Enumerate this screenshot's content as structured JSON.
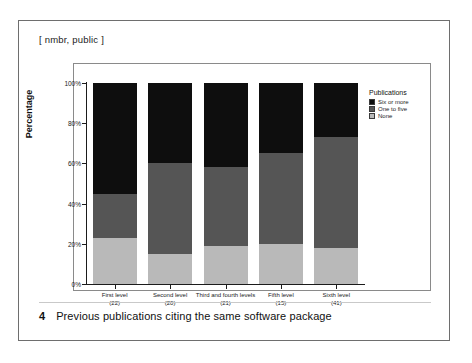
{
  "figure": {
    "subtitle": "[ nmbr, public ]",
    "caption_number": "4",
    "caption_text": "Previous publications citing the same software package"
  },
  "legend": {
    "title": "Publications",
    "entries": [
      {
        "label": "Six or more",
        "color": "#0e0e0e"
      },
      {
        "label": "One to five",
        "color": "#555555"
      },
      {
        "label": "None",
        "color": "#b9b9b9"
      }
    ]
  },
  "chart_data": {
    "type": "bar",
    "stacked": true,
    "stacked_mode": "percent",
    "title": "[ nmbr, public ]",
    "xlabel": "",
    "ylabel": "Percentage",
    "ylim": [
      0,
      100
    ],
    "grid": false,
    "legend_position": "right",
    "legend_title": "Publications",
    "categories": [
      "First level",
      "Second level",
      "Third and fourth levels",
      "Fifth level",
      "Sixth level"
    ],
    "category_counts": [
      "(22)",
      "(20)",
      "(21)",
      "(15)",
      "(41)"
    ],
    "ytick_labels": [
      "0%",
      "20%",
      "40%",
      "60%",
      "80%",
      "100%"
    ],
    "ytick_values": [
      0,
      20,
      40,
      60,
      80,
      100
    ],
    "series": [
      {
        "name": "None",
        "color": "#b9b9b9",
        "values": [
          23,
          15,
          19,
          20,
          18
        ]
      },
      {
        "name": "One to five",
        "color": "#555555",
        "values": [
          22,
          45,
          39,
          45,
          55
        ]
      },
      {
        "name": "Six or more",
        "color": "#0e0e0e",
        "values": [
          55,
          40,
          42,
          35,
          27
        ]
      }
    ]
  }
}
